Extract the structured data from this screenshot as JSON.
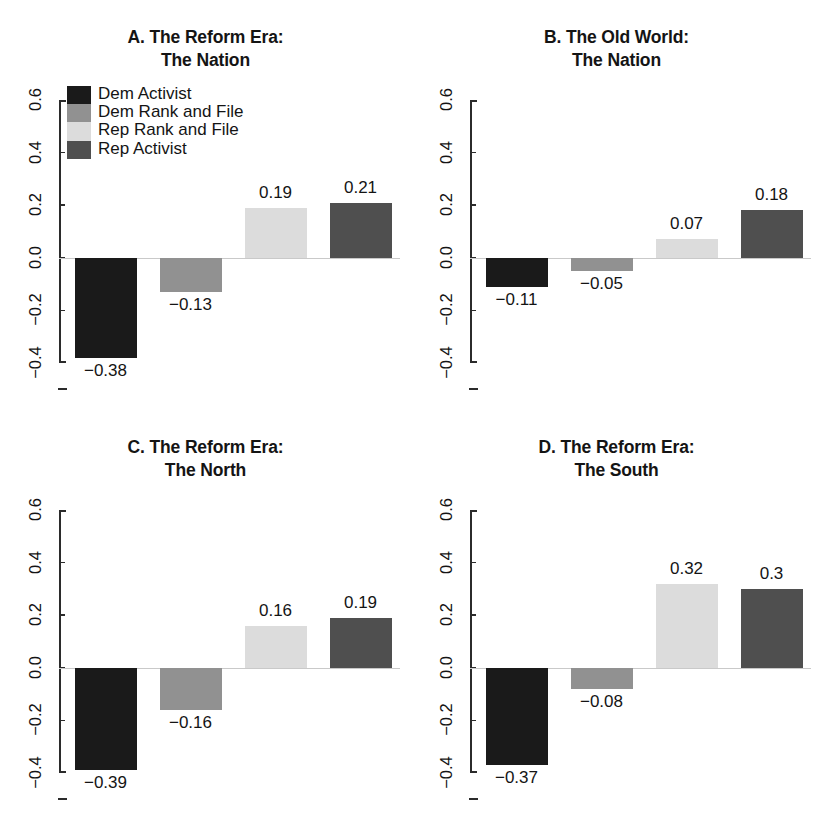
{
  "figure": {
    "background": "#ffffff"
  },
  "series_colors": {
    "dem_activist": "#1a1a1a",
    "dem_rank_and_file": "#919191",
    "rep_rank_and_file": "#dcdcdc",
    "rep_activist": "#4f4f4f"
  },
  "axis": {
    "tick_labels": [
      "0.6",
      "0.4",
      "0.2",
      "0.0",
      "-0.2",
      "-0.4"
    ],
    "tick_values": [
      0.6,
      0.4,
      0.2,
      0.0,
      -0.2,
      -0.4
    ],
    "ymin": -0.4,
    "ymax": 0.6,
    "zero_line_color": "#c9c9c9",
    "axis_color": "#2b2b2b"
  },
  "legend": {
    "items": [
      {
        "label": "Dem Activist",
        "color": "#1a1a1a"
      },
      {
        "label": "Dem Rank and File",
        "color": "#919191"
      },
      {
        "label": "Rep Rank and File",
        "color": "#dcdcdc"
      },
      {
        "label": "Rep Activist",
        "color": "#4f4f4f"
      }
    ]
  },
  "panels": [
    {
      "id": "A",
      "title_line1": "A. The Reform Era:",
      "title_line2": "The Nation"
    },
    {
      "id": "B",
      "title_line1": "B. The Old World:",
      "title_line2": "The Nation"
    },
    {
      "id": "C",
      "title_line1": "C. The Reform Era:",
      "title_line2": "The North"
    },
    {
      "id": "D",
      "title_line1": "D. The Reform Era:",
      "title_line2": "The South"
    }
  ],
  "chart_data": [
    {
      "type": "bar",
      "panel": "A",
      "title": "A. The Reform Era: The Nation",
      "xlabel": "",
      "ylabel": "",
      "ylim": [
        -0.4,
        0.6
      ],
      "yticks": [
        -0.4,
        -0.2,
        0.0,
        0.2,
        0.4,
        0.6
      ],
      "grid": false,
      "legend_position": "top-left",
      "categories": [
        "Dem Activist",
        "Dem Rank and File",
        "Rep Rank and File",
        "Rep Activist"
      ],
      "values": [
        -0.38,
        -0.13,
        0.19,
        0.21
      ],
      "value_labels": [
        "−0.38",
        "−0.13",
        "0.19",
        "0.21"
      ]
    },
    {
      "type": "bar",
      "panel": "B",
      "title": "B. The Old World: The Nation",
      "xlabel": "",
      "ylabel": "",
      "ylim": [
        -0.4,
        0.6
      ],
      "yticks": [
        -0.4,
        -0.2,
        0.0,
        0.2,
        0.4,
        0.6
      ],
      "grid": false,
      "legend_position": "none",
      "categories": [
        "Dem Activist",
        "Dem Rank and File",
        "Rep Rank and File",
        "Rep Activist"
      ],
      "values": [
        -0.11,
        -0.05,
        0.07,
        0.18
      ],
      "value_labels": [
        "−0.11",
        "−0.05",
        "0.07",
        "0.18"
      ]
    },
    {
      "type": "bar",
      "panel": "C",
      "title": "C. The Reform Era: The North",
      "xlabel": "",
      "ylabel": "",
      "ylim": [
        -0.4,
        0.6
      ],
      "yticks": [
        -0.4,
        -0.2,
        0.0,
        0.2,
        0.4,
        0.6
      ],
      "grid": false,
      "legend_position": "none",
      "categories": [
        "Dem Activist",
        "Dem Rank and File",
        "Rep Rank and File",
        "Rep Activist"
      ],
      "values": [
        -0.39,
        -0.16,
        0.16,
        0.19
      ],
      "value_labels": [
        "−0.39",
        "−0.16",
        "0.16",
        "0.19"
      ]
    },
    {
      "type": "bar",
      "panel": "D",
      "title": "D. The Reform Era: The South",
      "xlabel": "",
      "ylabel": "",
      "ylim": [
        -0.4,
        0.6
      ],
      "yticks": [
        -0.4,
        -0.2,
        0.0,
        0.2,
        0.4,
        0.6
      ],
      "grid": false,
      "legend_position": "none",
      "categories": [
        "Dem Activist",
        "Dem Rank and File",
        "Rep Rank and File",
        "Rep Activist"
      ],
      "values": [
        -0.37,
        -0.08,
        0.32,
        0.3
      ],
      "value_labels": [
        "−0.37",
        "−0.08",
        "0.32",
        "0.3"
      ]
    }
  ]
}
